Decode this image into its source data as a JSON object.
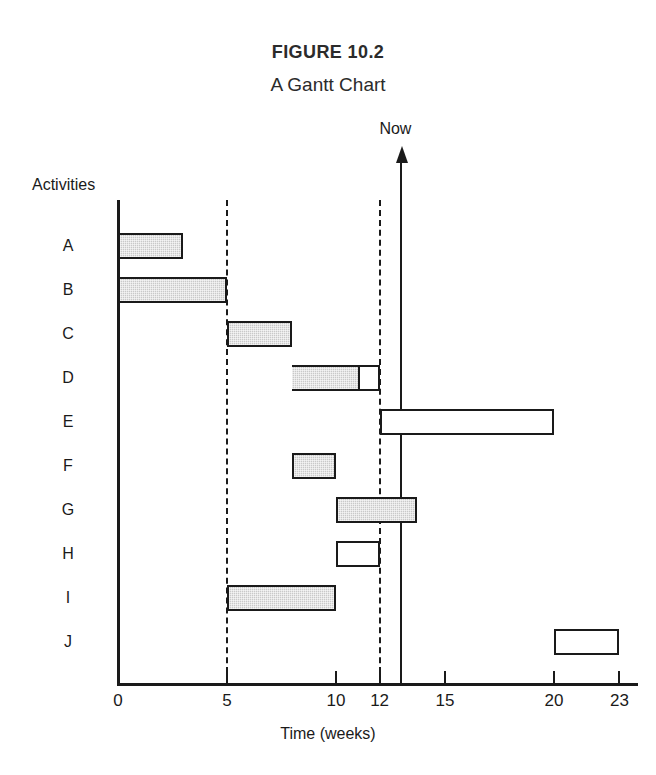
{
  "figure": {
    "number": "FIGURE 10.2",
    "title": "A Gantt Chart"
  },
  "labels": {
    "activities_header": "Activities",
    "now_marker": "Now",
    "x_axis_title": "Time (weeks)"
  },
  "chart_data": {
    "type": "bar",
    "title": "A Gantt Chart",
    "subtitle": "FIGURE 10.2",
    "xlabel": "Time (weeks)",
    "ylabel": "Activities",
    "xlim": [
      0,
      23.8
    ],
    "grid": false,
    "legend": null,
    "orientation": "horizontal",
    "xticks": [
      0,
      5,
      10,
      12,
      15,
      20,
      23
    ],
    "xtick_labels": [
      "0",
      "5",
      "10",
      "12",
      "15",
      "20",
      "23"
    ],
    "categories": [
      "A",
      "B",
      "C",
      "D",
      "E",
      "F",
      "G",
      "H",
      "I",
      "J"
    ],
    "annotations": [
      {
        "name": "Now",
        "x": 13,
        "style": "vertical-arrow"
      },
      {
        "name": "dashed-reference",
        "x": 5,
        "style": "vertical-dashed"
      },
      {
        "name": "dashed-reference",
        "x": 12,
        "style": "vertical-dashed"
      }
    ],
    "bars": [
      {
        "activity": "A",
        "start": 0,
        "end": 3,
        "progress_end": 3,
        "fill": "shaded"
      },
      {
        "activity": "B",
        "start": 0,
        "end": 5,
        "progress_end": 5,
        "fill": "shaded"
      },
      {
        "activity": "C",
        "start": 5,
        "end": 8,
        "progress_end": 8,
        "fill": "shaded"
      },
      {
        "activity": "D",
        "start": 8,
        "end": 12,
        "progress_end": 11,
        "fill": "partial"
      },
      {
        "activity": "E",
        "start": 12,
        "end": 20,
        "progress_end": 12,
        "fill": "open"
      },
      {
        "activity": "F",
        "start": 8,
        "end": 10,
        "progress_end": 10,
        "fill": "shaded"
      },
      {
        "activity": "G",
        "start": 10,
        "end": 13.7,
        "progress_end": 13.7,
        "fill": "shaded"
      },
      {
        "activity": "H",
        "start": 10,
        "end": 12,
        "progress_end": 10,
        "fill": "open"
      },
      {
        "activity": "I",
        "start": 5,
        "end": 10,
        "progress_end": 10,
        "fill": "shaded"
      },
      {
        "activity": "J",
        "start": 20,
        "end": 23,
        "progress_end": 20,
        "fill": "open"
      }
    ],
    "colors": {
      "shaded_fill": "#c9c9c9",
      "open_fill": "#ffffff",
      "stroke": "#1a1a1a",
      "background": "#ffffff"
    }
  }
}
